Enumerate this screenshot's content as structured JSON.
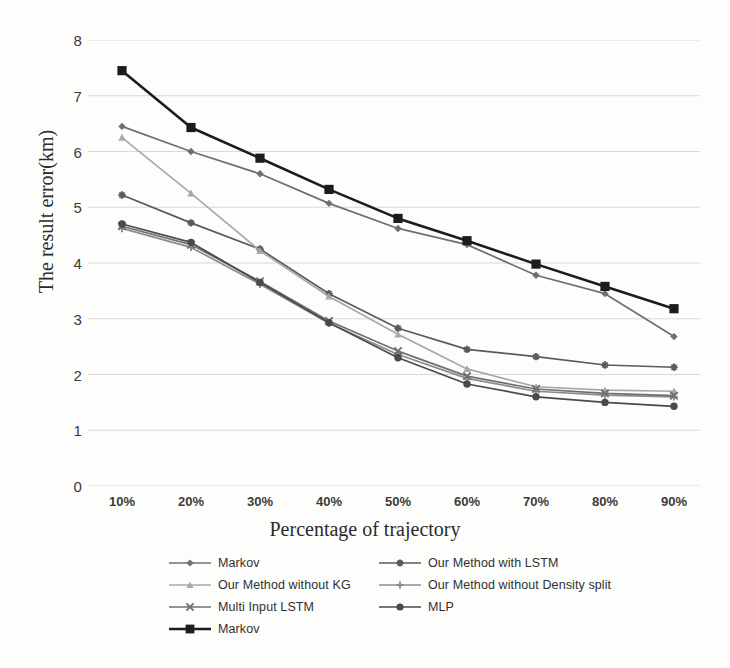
{
  "chart_data": {
    "type": "line",
    "title": "",
    "xlabel": "Percentage of trajectory",
    "ylabel": "The result error(km)",
    "categories": [
      "10%",
      "20%",
      "30%",
      "40%",
      "50%",
      "60%",
      "70%",
      "80%",
      "90%"
    ],
    "ylim": [
      0,
      8
    ],
    "yticks": [
      0,
      1,
      2,
      3,
      4,
      5,
      6,
      7,
      8
    ],
    "grid": "horizontal",
    "legend_position": "bottom",
    "series": [
      {
        "name": "Markov",
        "marker": "diamond",
        "color": "#6f6f6f",
        "values": [
          6.45,
          6.0,
          5.6,
          5.07,
          4.62,
          4.33,
          3.78,
          3.45,
          2.68
        ]
      },
      {
        "name": "Our Method with LSTM",
        "marker": "asterisk",
        "color": "#5a5a5a",
        "values": [
          5.22,
          4.72,
          4.25,
          3.45,
          2.83,
          2.45,
          2.32,
          2.17,
          2.13
        ]
      },
      {
        "name": "Our Method without KG",
        "marker": "triangle",
        "color": "#a8a8a8",
        "values": [
          6.25,
          5.25,
          4.22,
          3.4,
          2.72,
          2.1,
          1.78,
          1.72,
          1.7
        ]
      },
      {
        "name": "Our Method without Density split",
        "marker": "plus",
        "color": "#8c8c8c",
        "values": [
          4.62,
          4.28,
          3.62,
          2.92,
          2.36,
          1.93,
          1.7,
          1.63,
          1.6
        ]
      },
      {
        "name": "Multi Input LSTM",
        "marker": "x",
        "color": "#707070",
        "values": [
          4.66,
          4.33,
          3.67,
          2.96,
          2.42,
          1.97,
          1.74,
          1.66,
          1.62
        ]
      },
      {
        "name": "MLP",
        "marker": "circle",
        "color": "#4a4a4a",
        "values": [
          4.7,
          4.37,
          3.65,
          2.93,
          2.3,
          1.83,
          1.6,
          1.5,
          1.43
        ]
      },
      {
        "name": "Markov",
        "marker": "square",
        "color": "#1c1c1c",
        "values": [
          7.45,
          6.43,
          5.88,
          5.32,
          4.8,
          4.4,
          3.98,
          3.58,
          3.18
        ]
      }
    ]
  },
  "legend": {
    "rows": [
      [
        {
          "label": "Markov",
          "marker": "diamond",
          "color": "#6f6f6f"
        },
        {
          "label": "Our Method with LSTM",
          "marker": "asterisk",
          "color": "#5a5a5a"
        }
      ],
      [
        {
          "label": "Our Method without KG",
          "marker": "triangle",
          "color": "#a8a8a8"
        },
        {
          "label": "Our Method without Density split",
          "marker": "plus",
          "color": "#8c8c8c"
        }
      ],
      [
        {
          "label": "Multi Input LSTM",
          "marker": "x",
          "color": "#707070"
        },
        {
          "label": "MLP",
          "marker": "circle",
          "color": "#4a4a4a"
        }
      ],
      [
        {
          "label": "Markov",
          "marker": "square",
          "color": "#1c1c1c"
        }
      ]
    ]
  }
}
